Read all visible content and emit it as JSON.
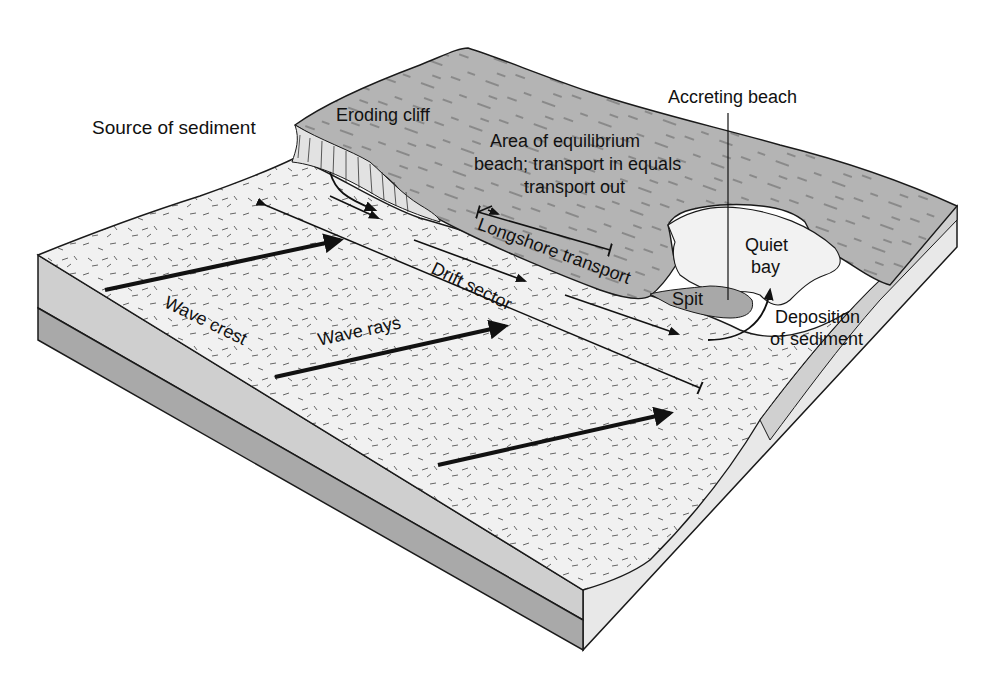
{
  "figure": {
    "colors": {
      "land": "#b4b4b4",
      "beach": "#f0f0f0",
      "block_side_light": "#e6e6e6",
      "block_side_mid": "#c8c8c8",
      "block_side_dark": "#a8a8a8",
      "outline": "#1a1a1a"
    }
  },
  "labels": {
    "source_of_sediment": "Source of sediment",
    "eroding_cliff": "Eroding cliff",
    "equilibrium_line1": "Area of equilibrium",
    "equilibrium_line2": "beach; transport in equals",
    "equilibrium_line3": "transport out",
    "accreting_beach": "Accreting beach",
    "quiet_bay_line1": "Quiet",
    "quiet_bay_line2": "bay",
    "longshore_transport": "Longshore transport",
    "drift_sector": "Drift sector",
    "spit": "Spit",
    "deposition_line1": "Deposition",
    "deposition_line2": "of sediment",
    "wave_crest": "Wave crest",
    "wave_rays": "Wave rays"
  }
}
